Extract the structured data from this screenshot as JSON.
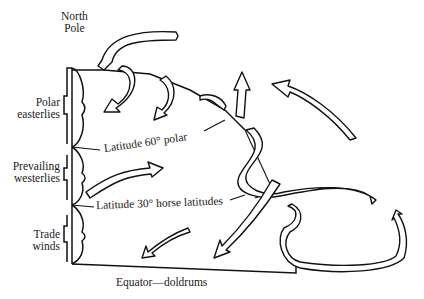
{
  "diagram": {
    "labels": {
      "north_pole": [
        "North",
        "Pole"
      ],
      "polar_easterlies": [
        "Polar",
        "easterlies"
      ],
      "prevailing_westerlies": [
        "Prevailing",
        "westerlies"
      ],
      "trade_winds": [
        "Trade",
        "winds"
      ],
      "latitude_60": "Latitude 60° polar",
      "latitude_30": "Latitude 30° horse latitudes",
      "equator": "Equator—doldrums"
    },
    "zones": [
      {
        "name": "Polar easterlies",
        "from": "North Pole",
        "to": "Latitude 60°"
      },
      {
        "name": "Prevailing westerlies",
        "from": "Latitude 60°",
        "to": "Latitude 30°"
      },
      {
        "name": "Trade winds",
        "from": "Latitude 30°",
        "to": "Equator"
      }
    ],
    "colors": {
      "ink": "#111111",
      "background": "#ffffff"
    }
  }
}
